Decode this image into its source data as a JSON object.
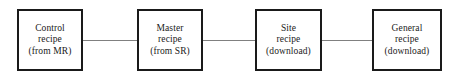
{
  "diagram": {
    "type": "flow-chain",
    "colors": {
      "background": "#ffffff",
      "box_fill": "#ffffff",
      "box_border": "#1a1a1a",
      "connector": "#808080",
      "text": "#1a1a1a"
    },
    "nodes": [
      {
        "id": "control-recipe",
        "lines": [
          "Control",
          "recipe",
          "(from MR)"
        ],
        "line1": "Control",
        "line2": "recipe",
        "line3": "(from MR)"
      },
      {
        "id": "master-recipe",
        "lines": [
          "Master",
          "recipe",
          "(from SR)"
        ],
        "line1": "Master",
        "line2": "recipe",
        "line3": "(from SR)"
      },
      {
        "id": "site-recipe",
        "lines": [
          "Site",
          "recipe",
          "(download)"
        ],
        "line1": "Site",
        "line2": "recipe",
        "line3": "(download)"
      },
      {
        "id": "general-recipe",
        "lines": [
          "General",
          "recipe",
          "(download)"
        ],
        "line1": "General",
        "line2": "recipe",
        "line3": "(download)"
      }
    ],
    "connectors": [
      {
        "from": "control-recipe",
        "to": "master-recipe",
        "style": "plain-line"
      },
      {
        "from": "master-recipe",
        "to": "site-recipe",
        "style": "plain-line"
      },
      {
        "from": "site-recipe",
        "to": "general-recipe",
        "style": "plain-line"
      }
    ]
  }
}
